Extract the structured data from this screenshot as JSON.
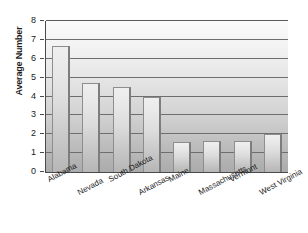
{
  "chart_data": {
    "type": "bar",
    "title": "",
    "xlabel": "",
    "ylabel": "Average Number",
    "ylim": [
      0,
      8
    ],
    "ytick_step": 1,
    "grid": true,
    "legend": false,
    "categories": [
      "Alabama",
      "Nevada",
      "South Dakota",
      "Arkansas",
      "Maine",
      "Massachusetts",
      "Vermont",
      "West Virginia"
    ],
    "values": [
      6.7,
      4.7,
      4.5,
      4.0,
      1.6,
      1.65,
      1.65,
      2.0
    ],
    "ytick_labels": [
      "8",
      "7",
      "6",
      "5",
      "4",
      "3",
      "2",
      "1",
      "0"
    ],
    "ytick_values": [
      8,
      7,
      6,
      5,
      4,
      3,
      2,
      1,
      0
    ]
  },
  "axis": {
    "y_title": "Average Number"
  },
  "colors": {
    "bar_face": "#dcdcdc",
    "bar_edge": "#8d8d8d",
    "gridline": "#6e6e6e",
    "axis": "#4a4a4a",
    "text": "#1a1a1a",
    "plot_bg_top": "#fbfbfb",
    "plot_bg_bottom": "#ababab"
  }
}
